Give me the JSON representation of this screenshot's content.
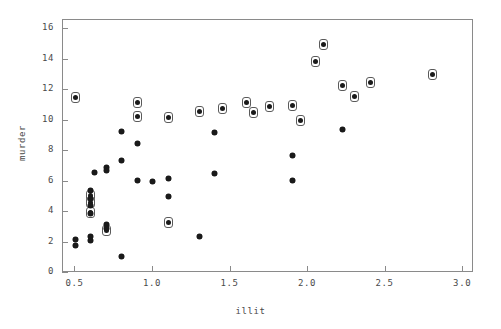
{
  "figure": {
    "background_color": "#ffffff",
    "frame_color": "#8a8a8a",
    "marker_color": "#1a1a1a"
  },
  "chart_data": {
    "type": "scatter",
    "title": "",
    "xlabel": "illit",
    "ylabel": "murder",
    "xlim": [
      0.42,
      3.07
    ],
    "ylim": [
      0,
      16.6
    ],
    "grid": false,
    "legend": null,
    "xticks": [
      0.5,
      1.0,
      1.5,
      2.0,
      2.5,
      3.0
    ],
    "xticklabels": [
      "0.5",
      "1.0",
      "1.5",
      "2.0",
      "2.5",
      "3.0"
    ],
    "yticks": [
      0,
      2,
      4,
      6,
      8,
      10,
      12,
      14,
      16
    ],
    "yticklabels": [
      "0",
      "2",
      "4",
      "6",
      "8",
      "10",
      "12",
      "14",
      "16"
    ],
    "series": [
      {
        "name": "circled",
        "marker": "asterisk-in-circle",
        "points": [
          {
            "x": 0.5,
            "y": 11.5
          },
          {
            "x": 0.9,
            "y": 11.2
          },
          {
            "x": 0.9,
            "y": 10.3
          },
          {
            "x": 1.1,
            "y": 10.2
          },
          {
            "x": 1.3,
            "y": 10.6
          },
          {
            "x": 1.45,
            "y": 10.8
          },
          {
            "x": 1.6,
            "y": 11.2
          },
          {
            "x": 1.65,
            "y": 10.5
          },
          {
            "x": 1.75,
            "y": 10.9
          },
          {
            "x": 1.9,
            "y": 11.0
          },
          {
            "x": 1.95,
            "y": 10.0
          },
          {
            "x": 2.05,
            "y": 13.9
          },
          {
            "x": 2.1,
            "y": 15.0
          },
          {
            "x": 2.22,
            "y": 12.3
          },
          {
            "x": 2.3,
            "y": 11.6
          },
          {
            "x": 2.4,
            "y": 12.5
          },
          {
            "x": 2.8,
            "y": 13.0
          },
          {
            "x": 0.6,
            "y": 4.6
          },
          {
            "x": 0.6,
            "y": 4.0
          },
          {
            "x": 0.7,
            "y": 2.8
          },
          {
            "x": 1.1,
            "y": 3.3
          },
          {
            "x": 0.6,
            "y": 5.1
          }
        ]
      },
      {
        "name": "plain",
        "marker": "asterisk",
        "points": [
          {
            "x": 0.5,
            "y": 2.2
          },
          {
            "x": 0.5,
            "y": 1.8
          },
          {
            "x": 0.6,
            "y": 5.4
          },
          {
            "x": 0.6,
            "y": 4.9
          },
          {
            "x": 0.6,
            "y": 4.4
          },
          {
            "x": 0.6,
            "y": 3.9
          },
          {
            "x": 0.6,
            "y": 2.4
          },
          {
            "x": 0.6,
            "y": 2.1
          },
          {
            "x": 0.62,
            "y": 6.6
          },
          {
            "x": 0.7,
            "y": 6.9
          },
          {
            "x": 0.7,
            "y": 6.7
          },
          {
            "x": 0.7,
            "y": 3.2
          },
          {
            "x": 0.7,
            "y": 2.9
          },
          {
            "x": 0.8,
            "y": 9.3
          },
          {
            "x": 0.8,
            "y": 7.4
          },
          {
            "x": 0.9,
            "y": 8.5
          },
          {
            "x": 0.9,
            "y": 6.1
          },
          {
            "x": 0.8,
            "y": 1.1
          },
          {
            "x": 1.0,
            "y": 6.0
          },
          {
            "x": 1.1,
            "y": 6.2
          },
          {
            "x": 1.1,
            "y": 5.0
          },
          {
            "x": 1.3,
            "y": 2.4
          },
          {
            "x": 1.4,
            "y": 9.2
          },
          {
            "x": 1.4,
            "y": 6.5
          },
          {
            "x": 1.9,
            "y": 7.7
          },
          {
            "x": 1.9,
            "y": 6.1
          },
          {
            "x": 2.22,
            "y": 9.4
          }
        ]
      }
    ]
  }
}
